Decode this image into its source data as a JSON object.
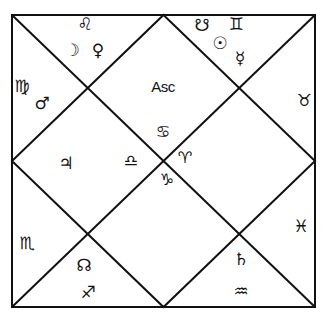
{
  "chart": {
    "title": "",
    "style": "North Indian diamond chart",
    "line_color": "#111111",
    "background": "#ffffff",
    "center_label": "Asc",
    "houses": [
      {
        "house": 1,
        "sign": "Cancer",
        "sign_glyph": "♋",
        "planets": [],
        "label": "Asc"
      },
      {
        "house": 2,
        "sign": "Leo",
        "sign_glyph": "♌",
        "planets": [
          {
            "name": "Moon",
            "glyph": "☽"
          },
          {
            "name": "Venus",
            "glyph": "♀"
          }
        ]
      },
      {
        "house": 3,
        "sign": "Virgo",
        "sign_glyph": "♍",
        "planets": [
          {
            "name": "Mars",
            "glyph": "♂"
          }
        ]
      },
      {
        "house": 4,
        "sign": "Libra",
        "sign_glyph": "♎",
        "planets": [
          {
            "name": "Jupiter",
            "glyph": "♃"
          }
        ]
      },
      {
        "house": 5,
        "sign": "Scorpio",
        "sign_glyph": "♏",
        "planets": []
      },
      {
        "house": 6,
        "sign": "Sagittarius",
        "sign_glyph": "♐",
        "planets": [
          {
            "name": "Rahu",
            "glyph": "☊"
          }
        ]
      },
      {
        "house": 7,
        "sign": "Capricorn",
        "sign_glyph": "♑",
        "planets": []
      },
      {
        "house": 8,
        "sign": "Aquarius",
        "sign_glyph": "♒",
        "planets": [
          {
            "name": "Saturn",
            "glyph": "♄"
          }
        ]
      },
      {
        "house": 9,
        "sign": "Pisces",
        "sign_glyph": "♓",
        "planets": []
      },
      {
        "house": 10,
        "sign": "Aries",
        "sign_glyph": "♈",
        "planets": []
      },
      {
        "house": 11,
        "sign": "Taurus",
        "sign_glyph": "♉",
        "planets": []
      },
      {
        "house": 12,
        "sign": "Gemini",
        "sign_glyph": "♊",
        "planets": [
          {
            "name": "Ketu",
            "glyph": "☋"
          },
          {
            "name": "Sun",
            "glyph": "☉"
          },
          {
            "name": "Mercury",
            "glyph": "☿"
          }
        ]
      }
    ]
  },
  "glyphs": {
    "asc": "Asc",
    "cancer": "♋",
    "leo": "♌",
    "moon": "☽",
    "venus": "♀",
    "virgo": "♍",
    "mars": "♂",
    "jupiter": "♃",
    "libra": "♎",
    "scorpio": "♏",
    "rahu": "☊",
    "sagittarius": "♐",
    "capricorn": "♑",
    "aries": "♈",
    "saturn": "♄",
    "aquarius": "♒",
    "pisces": "♓",
    "taurus": "♉",
    "ketu": "☋",
    "gemini": "♊",
    "sun": "☉",
    "mercury": "☿"
  }
}
